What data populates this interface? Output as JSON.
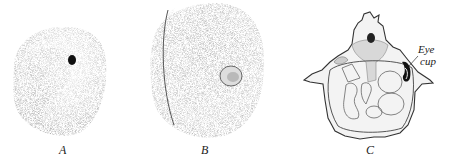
{
  "figures": [
    {
      "id": "A",
      "label": "A",
      "description": "stippled rounded embryo with small dark eye spot"
    },
    {
      "id": "B",
      "label": "B",
      "description": "larger stippled rounded embryo with lens vesicle"
    },
    {
      "id": "C",
      "label": "C",
      "description": "cross-section outline diagram"
    }
  ],
  "annotations": {
    "eye_cup_line1": "Eye",
    "eye_cup_line2": "cup"
  },
  "colors": {
    "background": "#ffffff",
    "ink": "#2a2a2a",
    "stipple": "#8a8a8a"
  }
}
